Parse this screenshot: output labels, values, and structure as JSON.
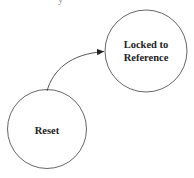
{
  "diagram": {
    "type": "state-diagram",
    "top_cutoff_text": "y",
    "states": [
      {
        "id": "locked",
        "label_lines": [
          "Locked to",
          "Reference"
        ],
        "cx": 146,
        "cy": 51,
        "r": 41
      },
      {
        "id": "reset",
        "label_lines": [
          "Reset"
        ],
        "cx": 47,
        "cy": 129,
        "r": 39
      }
    ],
    "transitions": [
      {
        "from": "reset",
        "to": "locked",
        "label": ""
      }
    ],
    "colors": {
      "stroke": "#555555",
      "text": "#222222",
      "background": "#ffffff"
    }
  }
}
